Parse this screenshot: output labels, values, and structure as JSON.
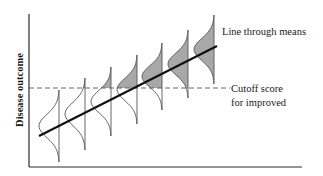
{
  "diagram": {
    "y_axis_label": "Disease outcome",
    "line_label": "Line through means",
    "cutoff_label_line1": "Cutoff score",
    "cutoff_label_line2": "for improved",
    "colors": {
      "axis": "#2a2a2a",
      "regression_line": "#111111",
      "curve_stroke": "#555555",
      "shade": "#a8a8a8",
      "dashed": "#555555"
    },
    "geometry": {
      "axis_origin": [
        29,
        167
      ],
      "y_axis_top": 14,
      "x_axis_right": 302,
      "cutoff_y": 88,
      "cutoff_x_end": 230,
      "regression_line": [
        [
          39,
          136
        ],
        [
          217,
          46
        ]
      ],
      "distributions": [
        {
          "x": 59,
          "top": 90,
          "bottom": 162
        },
        {
          "x": 85,
          "top": 78,
          "bottom": 150
        },
        {
          "x": 111,
          "top": 67,
          "bottom": 136
        },
        {
          "x": 137,
          "top": 55,
          "bottom": 124
        },
        {
          "x": 162,
          "top": 43,
          "bottom": 110
        },
        {
          "x": 188,
          "top": 30,
          "bottom": 98
        },
        {
          "x": 214,
          "top": 15,
          "bottom": 84
        }
      ],
      "curve_width": 20
    }
  }
}
